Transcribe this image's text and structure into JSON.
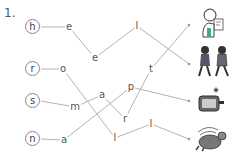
{
  "exercise_number": "1.",
  "start_letters": [
    "h",
    "r",
    "s",
    "n"
  ],
  "path_letters": {
    "h_path": [
      "e",
      "e",
      "l"
    ],
    "r_path": [
      "o",
      "l",
      "l"
    ],
    "s_path": [
      "m",
      "a",
      "r",
      "t"
    ],
    "n_path": [
      "a",
      "p"
    ]
  },
  "pictures": [
    {
      "name": "girl-with-paper",
      "description": "girl holding a paper"
    },
    {
      "name": "walking-children",
      "description": "two children walking"
    },
    {
      "name": "steaming-box",
      "description": "box with sparkle"
    },
    {
      "name": "rolling-cat",
      "description": "cat rolling"
    }
  ],
  "colors": {
    "line": "#aaaaaa",
    "text": "#555555",
    "circle": "#888888"
  }
}
